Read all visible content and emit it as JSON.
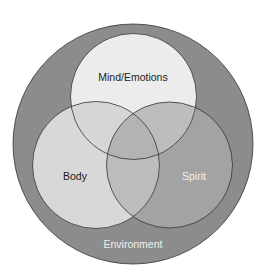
{
  "diagram": {
    "type": "venn",
    "outer": {
      "label": "Environment",
      "fill": "#8c8c8c",
      "label_color": "#eeeeee"
    },
    "circles": [
      {
        "id": "mind",
        "label": "Mind/Emotions",
        "fill": "#ececec",
        "label_color": "#222222"
      },
      {
        "id": "body",
        "label": "Body",
        "fill": "#d8d8d8",
        "label_color": "#222222"
      },
      {
        "id": "spirit",
        "label": "Spirit",
        "fill": "#a3a3a3",
        "label_color": "#f2f2f2"
      }
    ],
    "overlap_colors": {
      "mind_body": "#d2d2d2",
      "mind_spirit": "#b8b8b8",
      "body_spirit": "#b8b8b8",
      "all": "#b0b0b0"
    },
    "stroke": "#333333"
  }
}
